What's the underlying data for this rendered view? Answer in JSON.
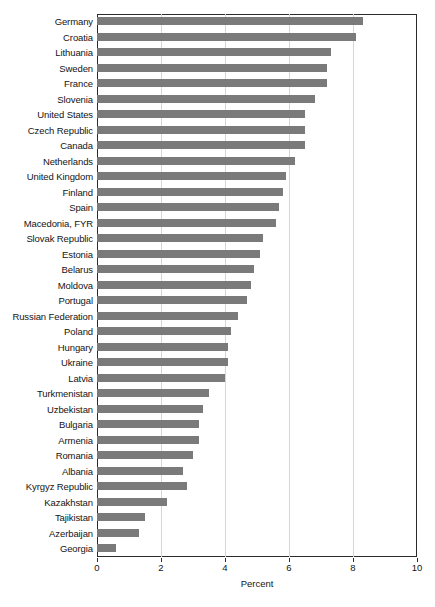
{
  "chart_data": {
    "type": "bar",
    "orientation": "horizontal",
    "title": "",
    "subtitle": "",
    "xlabel": "Percent",
    "ylabel": "",
    "xlim": [
      0,
      10
    ],
    "xticks": [
      0,
      2,
      4,
      6,
      8,
      10
    ],
    "xtick_labels": [
      "0",
      "2",
      "4",
      "6",
      "8",
      "10"
    ],
    "grid": "vertical",
    "legend": null,
    "bar_color": "#7a7a7a",
    "categories": [
      "Germany",
      "Croatia",
      "Lithuania",
      "Sweden",
      "France",
      "Slovenia",
      "United States",
      "Czech Republic",
      "Canada",
      "Netherlands",
      "United Kingdom",
      "Finland",
      "Spain",
      "Macedonia, FYR",
      "Slovak Republic",
      "Estonia",
      "Belarus",
      "Moldova",
      "Portugal",
      "Russian Federation",
      "Poland",
      "Hungary",
      "Ukraine",
      "Latvia",
      "Turkmenistan",
      "Uzbekistan",
      "Bulgaria",
      "Armenia",
      "Romania",
      "Albania",
      "Kyrgyz Republic",
      "Kazakhstan",
      "Tajikistan",
      "Azerbaijan",
      "Georgia"
    ],
    "values": [
      8.3,
      8.1,
      7.3,
      7.2,
      7.2,
      6.8,
      6.5,
      6.5,
      6.5,
      6.2,
      5.9,
      5.8,
      5.7,
      5.6,
      5.2,
      5.1,
      4.9,
      4.8,
      4.7,
      4.4,
      4.2,
      4.1,
      4.1,
      4.0,
      3.5,
      3.3,
      3.2,
      3.2,
      3.0,
      2.7,
      2.8,
      2.2,
      1.5,
      1.3,
      0.6
    ]
  }
}
